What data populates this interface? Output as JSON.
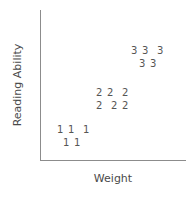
{
  "chart_data": {
    "type": "scatter",
    "title": "",
    "subtitle": "",
    "xlabel": "Weight",
    "ylabel": "Reading Ability",
    "grid": false,
    "legend": "none",
    "axis_style": "open L-shaped axes, no tick marks, no tick labels",
    "point_marker_style": "group-number-as-marker",
    "groups": [
      {
        "name": "1",
        "label": "1",
        "count": 5,
        "points": [
          {
            "label": "1",
            "x": 57,
            "y": 125
          },
          {
            "label": "1",
            "x": 68,
            "y": 125
          },
          {
            "label": "1",
            "x": 83,
            "y": 125
          },
          {
            "label": "1",
            "x": 63,
            "y": 138
          },
          {
            "label": "1",
            "x": 74,
            "y": 138
          }
        ]
      },
      {
        "name": "2",
        "label": "2",
        "count": 6,
        "points": [
          {
            "label": "2",
            "x": 96,
            "y": 88
          },
          {
            "label": "2",
            "x": 107,
            "y": 88
          },
          {
            "label": "2",
            "x": 122,
            "y": 88
          },
          {
            "label": "2",
            "x": 96,
            "y": 101
          },
          {
            "label": "2",
            "x": 111,
            "y": 101
          },
          {
            "label": "2",
            "x": 122,
            "y": 101
          }
        ]
      },
      {
        "name": "3",
        "label": "3",
        "count": 5,
        "points": [
          {
            "label": "3",
            "x": 131,
            "y": 46
          },
          {
            "label": "3",
            "x": 142,
            "y": 46
          },
          {
            "label": "3",
            "x": 157,
            "y": 46
          },
          {
            "label": "3",
            "x": 139,
            "y": 59
          },
          {
            "label": "3",
            "x": 150,
            "y": 59
          }
        ]
      }
    ],
    "colors": {
      "axis": "#8c8c8c",
      "marker_text": "#555555",
      "axis_title": "#4a4a4a",
      "background": "#ffffff"
    }
  }
}
